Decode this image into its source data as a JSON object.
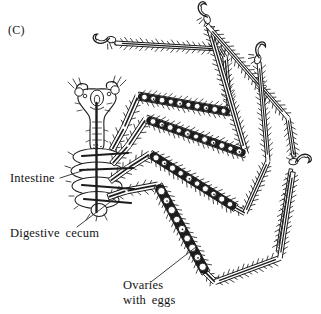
{
  "labels": {
    "panel": "(C)",
    "intestine": "Intestine",
    "digestive_cecum": "Digestive cecum",
    "ovaries_line1": "Ovaries",
    "ovaries_line2": "with eggs"
  },
  "colors": {
    "ink": "#1c1c1c",
    "leader_line": "#2a2a2a",
    "background": "#ffffff",
    "label_text": "#141414"
  }
}
